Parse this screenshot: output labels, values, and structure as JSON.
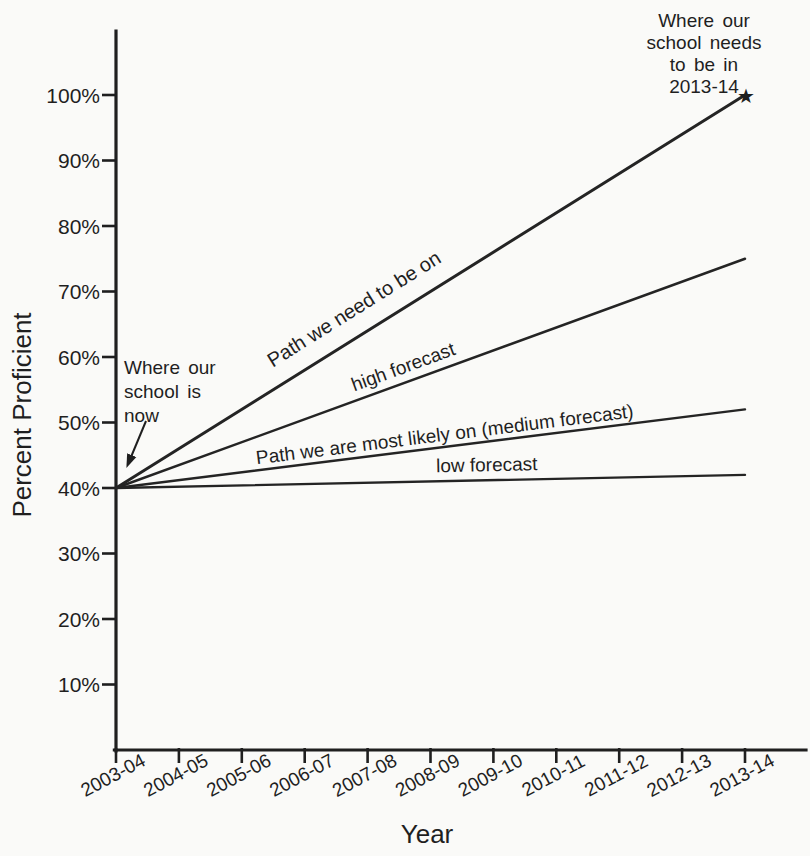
{
  "colors": {
    "ink": "#1f1f1f",
    "paper": "#fafaf8"
  },
  "chart_data": {
    "type": "line",
    "title": "",
    "xlabel": "Year",
    "ylabel": "Percent Proficient",
    "x_categories": [
      "2003-04",
      "2004-05",
      "2005-06",
      "2006-07",
      "2007-08",
      "2008-09",
      "2009-10",
      "2010-11",
      "2011-12",
      "2012-13",
      "2013-14"
    ],
    "y_tick_labels": [
      "10%",
      "20%",
      "30%",
      "40%",
      "50%",
      "60%",
      "70%",
      "80%",
      "90%",
      "100%"
    ],
    "ylim": [
      0,
      110
    ],
    "grid": "off",
    "legend": "labels-on-lines",
    "series": [
      {
        "name": "path-we-need-to-be-on",
        "label": "Path we need to be on",
        "x": [
          "2003-04",
          "2013-14"
        ],
        "x_indices": [
          0,
          10
        ],
        "values": [
          40,
          100
        ]
      },
      {
        "name": "high-forecast",
        "label": "high forecast",
        "x": [
          "2003-04",
          "2013-14"
        ],
        "x_indices": [
          0,
          10
        ],
        "values": [
          40,
          75
        ]
      },
      {
        "name": "medium-forecast",
        "label": "Path we are most likely on (medium forecast)",
        "x": [
          "2003-04",
          "2013-14"
        ],
        "x_indices": [
          0,
          10
        ],
        "values": [
          40,
          52
        ]
      },
      {
        "name": "low-forecast",
        "label": "low forecast",
        "x": [
          "2003-04",
          "2013-14"
        ],
        "x_indices": [
          0,
          10
        ],
        "values": [
          40,
          42
        ]
      }
    ],
    "annotations": [
      {
        "name": "school-now",
        "lines": [
          "Where our",
          "school is",
          "now"
        ],
        "points_to": {
          "year": "2003-04",
          "value": 40
        }
      },
      {
        "name": "school-needs",
        "lines": [
          "Where our",
          "school needs",
          "to be in",
          "2013-14"
        ],
        "marker": "star",
        "marker_glyph": "★",
        "at": {
          "year": "2013-14",
          "value": 100
        }
      }
    ]
  }
}
